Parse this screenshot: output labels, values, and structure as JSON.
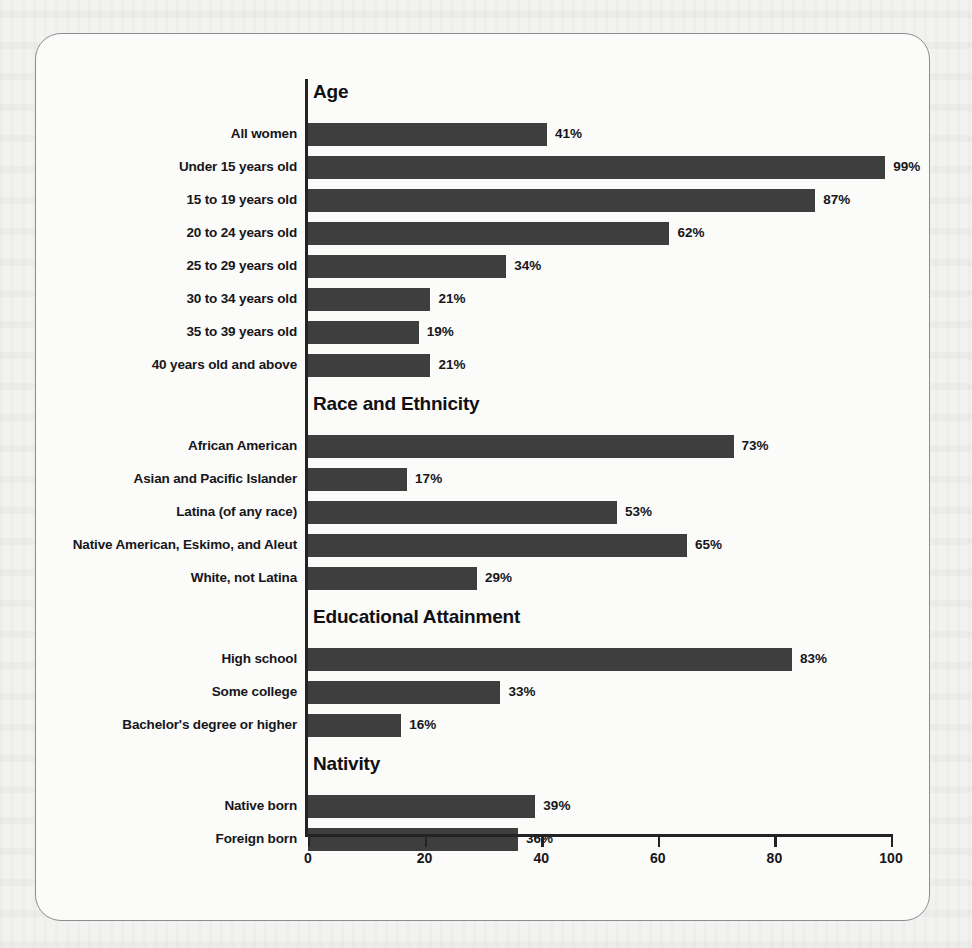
{
  "chart_data": {
    "type": "bar",
    "orientation": "horizontal",
    "title": "",
    "xlabel": "",
    "ylabel": "",
    "xlim": [
      0,
      100
    ],
    "xticks": [
      0,
      20,
      40,
      60,
      80,
      100
    ],
    "xtick_labels": [
      "0",
      "20",
      "40",
      "60",
      "80",
      "100"
    ],
    "grid": false,
    "legend": null,
    "value_suffix": "%",
    "bar_color": "#3e3e3f",
    "sections": [
      {
        "heading": "Age",
        "categories": [
          "All women",
          "Under 15 years old",
          "15 to 19 years old",
          "20 to 24 years old",
          "25 to 29 years old",
          "30 to 34 years old",
          "35 to 39 years old",
          "40 years old and above"
        ],
        "values": [
          41,
          99,
          87,
          62,
          34,
          21,
          19,
          21
        ],
        "value_labels": [
          "41%",
          "99%",
          "87%",
          "62%",
          "34%",
          "21%",
          "19%",
          "21%"
        ]
      },
      {
        "heading": "Race and Ethnicity",
        "categories": [
          "African American",
          "Asian and Pacific Islander",
          "Latina (of any race)",
          "Native American, Eskimo, and Aleut",
          "White, not Latina"
        ],
        "values": [
          73,
          17,
          53,
          65,
          29
        ],
        "value_labels": [
          "73%",
          "17%",
          "53%",
          "65%",
          "29%"
        ]
      },
      {
        "heading": "Educational Attainment",
        "categories": [
          "High school",
          "Some college",
          "Bachelor's degree or higher"
        ],
        "values": [
          83,
          33,
          16
        ],
        "value_labels": [
          "83%",
          "33%",
          "16%"
        ]
      },
      {
        "heading": "Nativity",
        "categories": [
          "Native born",
          "Foreign born"
        ],
        "values": [
          39,
          36
        ],
        "value_labels": [
          "39%",
          "36%"
        ]
      }
    ]
  }
}
